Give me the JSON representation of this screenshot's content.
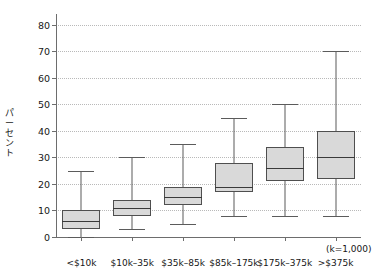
{
  "chart_data": {
    "type": "box",
    "title": "",
    "xlabel": "",
    "ylabel": "パーセント",
    "ylim": [
      0,
      84
    ],
    "yticks": [
      0,
      10,
      20,
      30,
      40,
      50,
      60,
      70,
      80
    ],
    "grid": true,
    "legend": "none",
    "axis_note": "(k=1,000)",
    "categories": [
      "<$10k",
      "$10k–35k",
      "$35k–85k",
      "$85k–175k",
      "$175k–375k",
      ">$375k"
    ],
    "boxes": [
      {
        "category": "<$10k",
        "whisker_low": 0,
        "q1": 3,
        "median": 6,
        "q3": 10,
        "whisker_high": 25
      },
      {
        "category": "$10k–35k",
        "whisker_low": 3,
        "q1": 8,
        "median": 11,
        "q3": 14,
        "whisker_high": 30
      },
      {
        "category": "$35k–85k",
        "whisker_low": 5,
        "q1": 12,
        "median": 15,
        "q3": 19,
        "whisker_high": 35
      },
      {
        "category": "$85k–175k",
        "whisker_low": 8,
        "q1": 17,
        "median": 19,
        "q3": 28,
        "whisker_high": 45
      },
      {
        "category": "$175k–375k",
        "whisker_low": 8,
        "q1": 21,
        "median": 26,
        "q3": 34,
        "whisker_high": 50
      },
      {
        "category": ">$375k",
        "whisker_low": 8,
        "q1": 22,
        "median": 30,
        "q3": 40,
        "whisker_high": 70
      }
    ],
    "colors": {
      "box_fill": "#d9d9d9",
      "box_border": "#4f4f4f",
      "median": "#3a3a3a",
      "whisker": "#5b5b5b",
      "grid": "#b9b9b9",
      "axis": "#6d6d6d",
      "text": "#161616",
      "background": "#ffffff"
    }
  }
}
